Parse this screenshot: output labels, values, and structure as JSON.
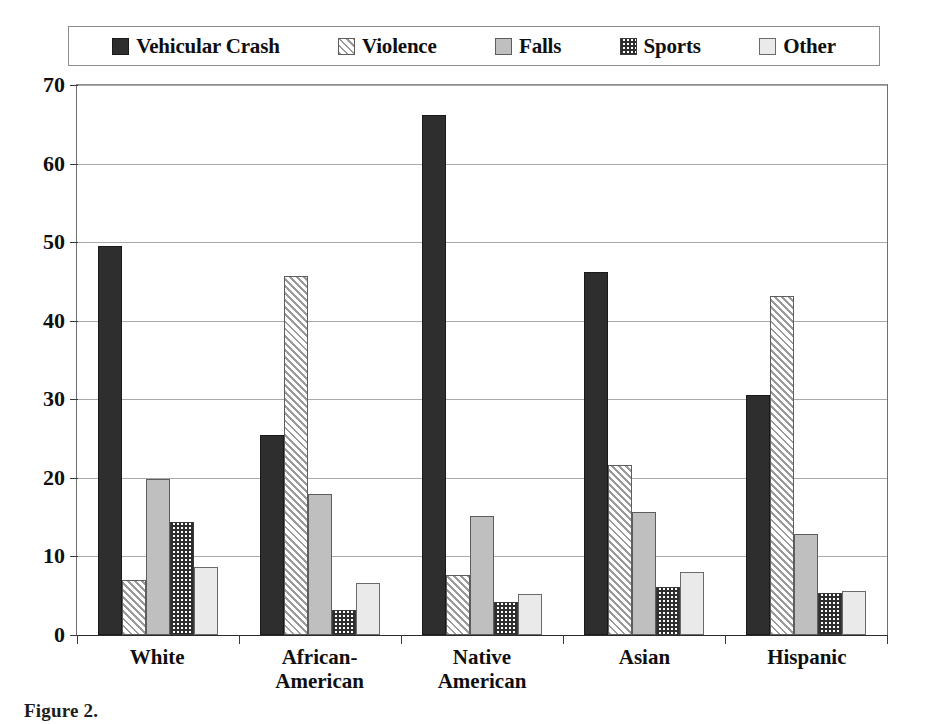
{
  "chart_data": {
    "type": "bar",
    "title": "",
    "xlabel": "",
    "ylabel": "",
    "ylim": [
      0,
      70
    ],
    "ytick_step": 10,
    "yticks": [
      70,
      60,
      50,
      40,
      30,
      20,
      10,
      0
    ],
    "grid": true,
    "legend_position": "top",
    "categories": [
      "White",
      "African-American",
      "Native American",
      "Asian",
      "Hispanic"
    ],
    "category_lines": [
      [
        "White"
      ],
      [
        "African-",
        "American"
      ],
      [
        "Native",
        "American"
      ],
      [
        "Asian"
      ],
      [
        "Hispanic"
      ]
    ],
    "series": [
      {
        "name": "Vehicular Crash",
        "pattern": "solid-dark",
        "color": "#2e2e2e",
        "values": [
          49.5,
          25.5,
          66.2,
          46.2,
          30.5
        ]
      },
      {
        "name": "Violence",
        "pattern": "diagonal",
        "color": "#9a9a9a",
        "values": [
          7.0,
          45.7,
          7.6,
          21.7,
          43.2
        ]
      },
      {
        "name": "Falls",
        "pattern": "solid-gray",
        "color": "#bfbfbf",
        "values": [
          19.9,
          17.9,
          15.1,
          15.7,
          12.8
        ]
      },
      {
        "name": "Sports",
        "pattern": "checkerboard",
        "color": "#2e2e2e",
        "values": [
          14.4,
          3.2,
          4.2,
          6.1,
          5.4
        ]
      },
      {
        "name": "Other",
        "pattern": "light",
        "color": "#eaeaea",
        "values": [
          8.7,
          6.6,
          5.2,
          8.0,
          5.6
        ]
      }
    ]
  },
  "legend": {
    "entries": [
      {
        "label": "Vehicular Crash",
        "swatch": "solid-dark"
      },
      {
        "label": "Violence",
        "swatch": "diagonal"
      },
      {
        "label": "Falls",
        "swatch": "solid-gray"
      },
      {
        "label": "Sports",
        "swatch": "checkerboard"
      },
      {
        "label": "Other",
        "swatch": "light"
      }
    ]
  },
  "caption": {
    "text": "Figure 2."
  }
}
